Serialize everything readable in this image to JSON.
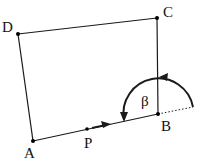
{
  "diagram": {
    "type": "geometry-figure",
    "colors": {
      "stroke": "#1a1a1a",
      "background": "#ffffff"
    },
    "points": {
      "A": {
        "label": "A",
        "x": 33,
        "y": 141
      },
      "B": {
        "label": "B",
        "x": 158,
        "y": 114
      },
      "C": {
        "label": "C",
        "x": 157,
        "y": 18
      },
      "D": {
        "label": "D",
        "x": 18,
        "y": 34
      },
      "P": {
        "label": "P",
        "x": 87,
        "y": 129
      }
    },
    "edges": [
      {
        "from": "A",
        "to": "B"
      },
      {
        "from": "B",
        "to": "C"
      },
      {
        "from": "C",
        "to": "D"
      },
      {
        "from": "D",
        "to": "A"
      }
    ],
    "angle": {
      "label": "β",
      "vertex": "B",
      "direction": "counterclockwise",
      "extension": "dotted"
    },
    "arrow_on_segment": "AB (at P, pointing toward B)"
  }
}
